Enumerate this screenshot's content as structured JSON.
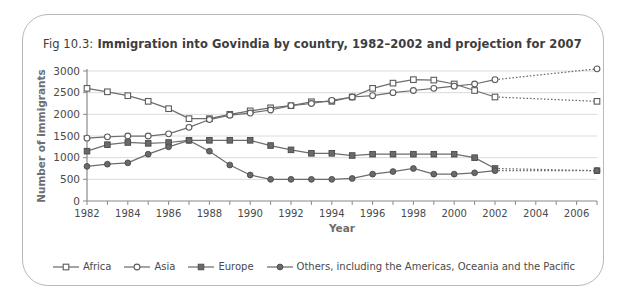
{
  "figure": {
    "label": "Fig 10.3:",
    "title": "Immigration into Govindia by country, 1982–2002 and projection for 2007"
  },
  "chart_data": {
    "type": "line",
    "title": "Fig 10.3: Immigration into Govindia by country, 1982–2002 and projection for 2007",
    "xlabel": "Year",
    "ylabel": "Number of immigrants",
    "xlim": [
      1982,
      2007
    ],
    "ylim": [
      0,
      3000
    ],
    "ytick_step": 500,
    "yticks": [
      0,
      500,
      1000,
      1500,
      2000,
      2500,
      3000
    ],
    "xticks": [
      1982,
      1983,
      1984,
      1985,
      1986,
      1987,
      1988,
      1989,
      1990,
      1991,
      1992,
      1993,
      1994,
      1995,
      1996,
      1997,
      1998,
      1999,
      2000,
      2001,
      2002,
      2003,
      2004,
      2005,
      2006,
      2007
    ],
    "xtick_labels": [
      "1982",
      "",
      "1984",
      "",
      "1986",
      "",
      "1988",
      "",
      "1990",
      "",
      "1992",
      "",
      "1994",
      "",
      "1996",
      "",
      "1998",
      "",
      "2000",
      "",
      "2002",
      "",
      "2004",
      "",
      "2006",
      ""
    ],
    "grid": "horizontal",
    "legend_position": "bottom",
    "projection_note": "Dotted segments from 2002 to 2007 are projections",
    "x": [
      1982,
      1983,
      1984,
      1985,
      1986,
      1987,
      1988,
      1989,
      1990,
      1991,
      1992,
      1993,
      1994,
      1995,
      1996,
      1997,
      1998,
      1999,
      2000,
      2001,
      2002
    ],
    "x_projection": [
      2002,
      2007
    ],
    "series": [
      {
        "name": "Africa",
        "marker": "open-square",
        "values": [
          2600,
          2520,
          2430,
          2300,
          2130,
          1900,
          1900,
          2000,
          2080,
          2150,
          2200,
          2290,
          2300,
          2400,
          2600,
          2720,
          2800,
          2790,
          2700,
          2550,
          2400
        ],
        "projection": [
          2400,
          2300
        ]
      },
      {
        "name": "Asia",
        "marker": "open-circle",
        "values": [
          1450,
          1480,
          1500,
          1500,
          1550,
          1700,
          1880,
          1980,
          2030,
          2100,
          2200,
          2250,
          2320,
          2400,
          2430,
          2500,
          2550,
          2600,
          2650,
          2700,
          2800
        ],
        "projection": [
          2800,
          3050
        ]
      },
      {
        "name": "Europe",
        "marker": "filled-square",
        "values": [
          1150,
          1300,
          1350,
          1330,
          1350,
          1400,
          1400,
          1400,
          1400,
          1280,
          1180,
          1100,
          1100,
          1050,
          1080,
          1080,
          1080,
          1080,
          1080,
          1000,
          750
        ],
        "projection": [
          750,
          700
        ]
      },
      {
        "name": "Others, including the Americas, Oceania and the Pacific",
        "marker": "filled-circle",
        "values": [
          800,
          850,
          880,
          1080,
          1250,
          1400,
          1150,
          830,
          600,
          500,
          500,
          500,
          500,
          520,
          620,
          680,
          750,
          620,
          620,
          650,
          700
        ],
        "projection": [
          700,
          700
        ]
      }
    ]
  }
}
